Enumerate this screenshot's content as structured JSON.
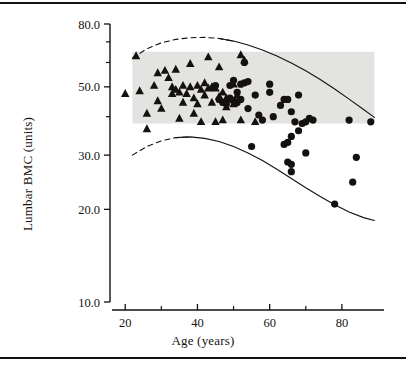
{
  "figure": {
    "name": "lumbar-bmc-vs-age-scatter",
    "background_color": "#ffffff",
    "ink_color": "#14110f",
    "band_color": "#e3e3e1"
  },
  "chart_data": {
    "type": "scatter",
    "title": "",
    "xlabel": "Age (years)",
    "ylabel": "Lumbar BMC (units)",
    "xlim": [
      18,
      90
    ],
    "ylim": [
      10.0,
      80.0
    ],
    "yscale": "log",
    "grid": false,
    "legend_position": "none",
    "x_ticks_major": [
      20,
      40,
      60,
      80
    ],
    "x_ticks_minor": [
      30,
      50,
      70
    ],
    "x_tick_labels": [
      "20",
      "40",
      "60",
      "80"
    ],
    "y_ticks_major": [
      10.0,
      20.0,
      30.0,
      50.0,
      80.0
    ],
    "y_tick_labels": [
      "10.0",
      "20.0",
      "30.0",
      "50.0",
      "80.0"
    ],
    "y_ticks_minor": [
      40.0,
      60.0,
      70.0
    ],
    "reference_band": {
      "label": "normal-range-shaded-band",
      "x_start": 22,
      "x_end": 89,
      "y_low": 38.0,
      "y_high": 65.0
    },
    "curves": [
      {
        "name": "upper-percentile-curve",
        "style": "dashed-then-solid",
        "dash_end_x": 47,
        "points": [
          [
            22,
            62.0
          ],
          [
            26,
            66.5
          ],
          [
            30,
            69.5
          ],
          [
            34,
            71.3
          ],
          [
            38,
            72.2
          ],
          [
            42,
            72.4
          ],
          [
            46,
            71.8
          ],
          [
            50,
            70.4
          ],
          [
            54,
            68.4
          ],
          [
            58,
            65.9
          ],
          [
            62,
            63.0
          ],
          [
            66,
            59.8
          ],
          [
            70,
            56.4
          ],
          [
            74,
            52.8
          ],
          [
            78,
            49.2
          ],
          [
            82,
            45.6
          ],
          [
            86,
            42.2
          ],
          [
            89,
            39.8
          ]
        ]
      },
      {
        "name": "lower-percentile-curve",
        "style": "dashed-then-solid",
        "dash_end_x": 36,
        "points": [
          [
            22,
            30.0
          ],
          [
            26,
            32.0
          ],
          [
            30,
            33.4
          ],
          [
            34,
            34.2
          ],
          [
            38,
            34.4
          ],
          [
            42,
            34.0
          ],
          [
            46,
            33.2
          ],
          [
            50,
            32.0
          ],
          [
            54,
            30.5
          ],
          [
            58,
            28.8
          ],
          [
            62,
            27.0
          ],
          [
            66,
            25.2
          ],
          [
            70,
            23.5
          ],
          [
            74,
            22.0
          ],
          [
            78,
            20.7
          ],
          [
            82,
            19.6
          ],
          [
            86,
            18.8
          ],
          [
            89,
            18.4
          ]
        ]
      }
    ],
    "series": [
      {
        "name": "Triangles",
        "marker": "triangle",
        "color": "#14110f",
        "count": 50,
        "points": [
          [
            20,
            47.5
          ],
          [
            23,
            63.0
          ],
          [
            24,
            48.5
          ],
          [
            26,
            41.0
          ],
          [
            26,
            36.5
          ],
          [
            28,
            50.5
          ],
          [
            29,
            55.5
          ],
          [
            29,
            45.0
          ],
          [
            30,
            42.5
          ],
          [
            31,
            56.5
          ],
          [
            32,
            53.5
          ],
          [
            33,
            50.0
          ],
          [
            33,
            47.5
          ],
          [
            34,
            49.0
          ],
          [
            34,
            57.0
          ],
          [
            35,
            48.0
          ],
          [
            35,
            39.5
          ],
          [
            36,
            50.5
          ],
          [
            36,
            44.5
          ],
          [
            37,
            47.5
          ],
          [
            38,
            50.0
          ],
          [
            38,
            59.5
          ],
          [
            39,
            46.0
          ],
          [
            39,
            41.0
          ],
          [
            40,
            50.5
          ],
          [
            40,
            44.0
          ],
          [
            41,
            49.0
          ],
          [
            41,
            38.5
          ],
          [
            42,
            51.5
          ],
          [
            42,
            47.0
          ],
          [
            43,
            49.5
          ],
          [
            43,
            62.5
          ],
          [
            44,
            50.0
          ],
          [
            44,
            44.5
          ],
          [
            45,
            49.5
          ],
          [
            45,
            38.5
          ],
          [
            46,
            58.0
          ],
          [
            46,
            46.5
          ],
          [
            47,
            48.0
          ],
          [
            47,
            39.0
          ],
          [
            48,
            46.0
          ],
          [
            48,
            43.0
          ],
          [
            49,
            45.5
          ],
          [
            50,
            51.0
          ],
          [
            50,
            44.0
          ],
          [
            51,
            47.0
          ],
          [
            52,
            39.0
          ],
          [
            52,
            63.5
          ],
          [
            53,
            61.0
          ],
          [
            56,
            38.5
          ]
        ]
      },
      {
        "name": "Circles",
        "marker": "circle",
        "color": "#14110f",
        "count": 46,
        "points": [
          [
            45,
            50.5
          ],
          [
            46,
            45.5
          ],
          [
            47,
            44.5
          ],
          [
            48,
            44.0
          ],
          [
            49,
            46.0
          ],
          [
            49,
            50.5
          ],
          [
            50,
            45.0
          ],
          [
            50,
            52.5
          ],
          [
            51,
            44.5
          ],
          [
            51,
            48.0
          ],
          [
            52,
            51.0
          ],
          [
            52,
            45.5
          ],
          [
            53,
            60.0
          ],
          [
            53,
            51.5
          ],
          [
            54,
            52.0
          ],
          [
            54,
            42.5
          ],
          [
            55,
            32.0
          ],
          [
            56,
            47.0
          ],
          [
            57,
            40.5
          ],
          [
            58,
            39.0
          ],
          [
            60,
            51.0
          ],
          [
            60,
            48.0
          ],
          [
            61,
            40.0
          ],
          [
            63,
            43.5
          ],
          [
            64,
            32.5
          ],
          [
            64,
            45.5
          ],
          [
            65,
            45.5
          ],
          [
            65,
            33.0
          ],
          [
            65,
            28.5
          ],
          [
            66,
            41.5
          ],
          [
            66,
            28.0
          ],
          [
            66,
            34.5
          ],
          [
            66,
            26.5
          ],
          [
            67,
            38.5
          ],
          [
            68,
            47.0
          ],
          [
            68,
            36.0
          ],
          [
            69,
            38.0
          ],
          [
            70,
            38.5
          ],
          [
            70,
            30.5
          ],
          [
            71,
            39.5
          ],
          [
            72,
            39.0
          ],
          [
            78,
            20.8
          ],
          [
            82,
            39.0
          ],
          [
            83,
            24.5
          ],
          [
            84,
            29.5
          ],
          [
            88,
            38.5
          ]
        ]
      }
    ]
  }
}
